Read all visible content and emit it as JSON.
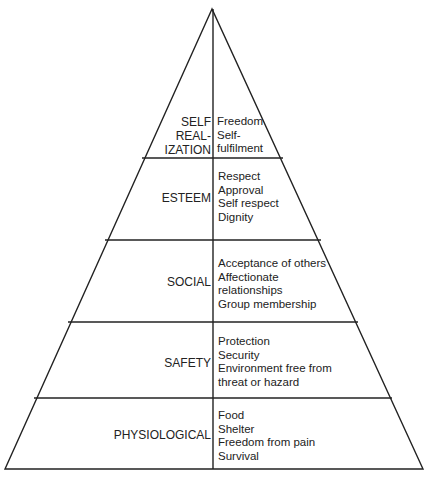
{
  "diagram": {
    "type": "pyramid",
    "levels": [
      {
        "name": "self-realization",
        "label_lines": [
          "SELF",
          "REAL-",
          "IZATION"
        ],
        "items": [
          "Freedom",
          "Self-",
          "fulfilment"
        ]
      },
      {
        "name": "esteem",
        "label_lines": [
          "ESTEEM"
        ],
        "items": [
          "Respect",
          "Approval",
          "Self respect",
          "Dignity"
        ]
      },
      {
        "name": "social",
        "label_lines": [
          "SOCIAL"
        ],
        "items": [
          "Acceptance of others",
          "Affectionate",
          "relationships",
          "Group membership"
        ]
      },
      {
        "name": "safety",
        "label_lines": [
          "SAFETY"
        ],
        "items": [
          "Protection",
          "Security",
          "Environment free from",
          "threat or hazard"
        ]
      },
      {
        "name": "physiological",
        "label_lines": [
          "PHYSIOLOGICAL"
        ],
        "items": [
          "Food",
          "Shelter",
          "Freedom from pain",
          "Survival"
        ]
      }
    ]
  }
}
